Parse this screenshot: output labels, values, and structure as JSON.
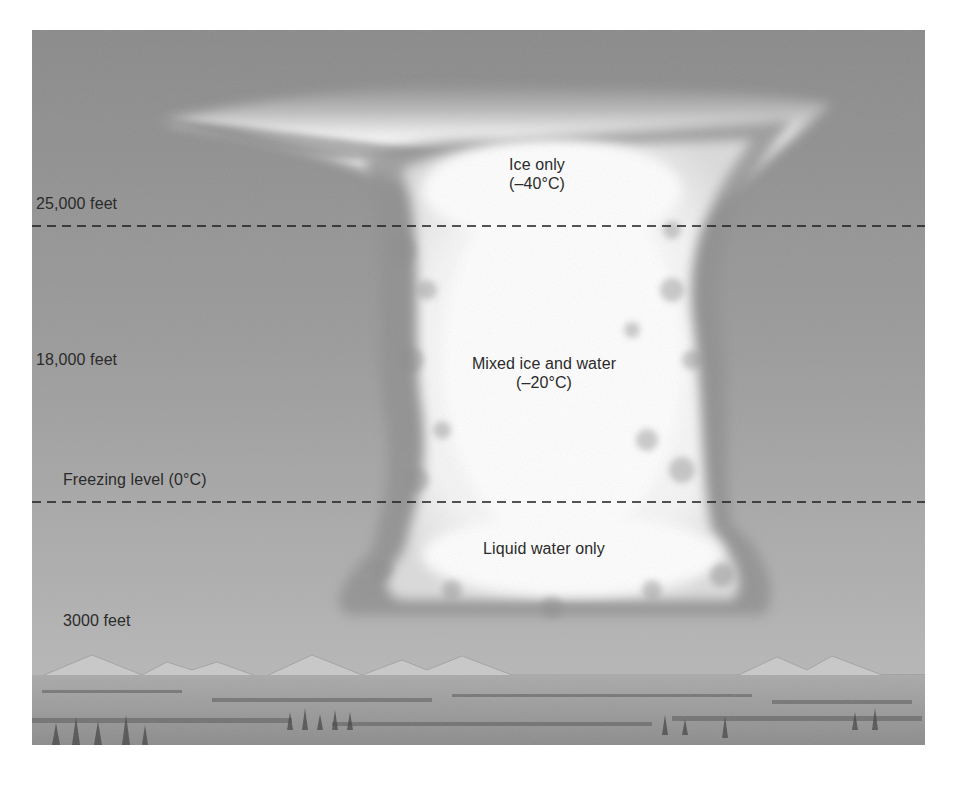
{
  "diagram": {
    "colors": {
      "sky_top": "#8a8a8a",
      "sky_mid": "#9c9c9c",
      "sky_low": "#b4b4b4",
      "cloud": "#ffffff",
      "cloud_shadow": "#7a7a7a",
      "dashed_line": "#1e1e1e",
      "ground": "#8d8d8d",
      "label_text": "#2b2b2b"
    },
    "altitude_labels": [
      {
        "id": "alt-25000",
        "text": "25,000 feet"
      },
      {
        "id": "alt-18000",
        "text": "18,000 feet"
      },
      {
        "id": "freezing",
        "text": "Freezing level (0°C)"
      },
      {
        "id": "alt-3000",
        "text": "3000 feet"
      }
    ],
    "zone_labels": {
      "ice": {
        "line1": "Ice only",
        "line2": "(–40°C)"
      },
      "mixed": {
        "line1": "Mixed ice and water",
        "line2": "(–20°C)"
      },
      "liquid": {
        "line1": "Liquid water only"
      }
    },
    "boundaries": [
      {
        "name": "25,000 feet line",
        "style": "dashed"
      },
      {
        "name": "freezing level line",
        "style": "dashed"
      }
    ]
  }
}
